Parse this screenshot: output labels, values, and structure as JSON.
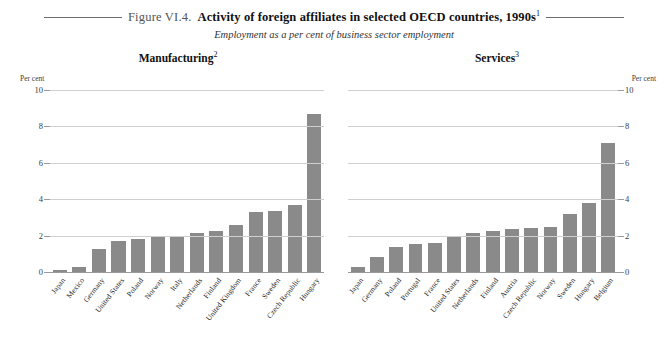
{
  "figure": {
    "label": "Figure VI.4.",
    "title": "Activity of foreign affiliates in selected OECD countries, 1990s",
    "title_footnote": "1",
    "subtitle": "Employment as a per cent of business sector employment"
  },
  "axis": {
    "unit_caption": "Per cent",
    "ticks": [
      "10",
      "8",
      "6",
      "4",
      "2",
      "0"
    ]
  },
  "chart_data": [
    {
      "type": "bar",
      "title": "Manufacturing",
      "title_footnote": "2",
      "xlabel": "",
      "ylabel": "Per cent",
      "ylim": [
        0,
        10
      ],
      "yticks": [
        0,
        2,
        4,
        6,
        8,
        10
      ],
      "grid": true,
      "legend": "none",
      "bar_color": "#8a8a8a",
      "categories": [
        "Japan",
        "Mexico",
        "Germany",
        "United States",
        "Poland",
        "Norway",
        "Italy",
        "Netherlands",
        "Finland",
        "United Kingdom",
        "France",
        "Sweden",
        "Czech Republic",
        "Hungary"
      ],
      "values": [
        0.1,
        0.3,
        1.25,
        1.7,
        1.8,
        1.95,
        2.0,
        2.15,
        2.25,
        2.6,
        3.3,
        3.35,
        3.7,
        8.7
      ]
    },
    {
      "type": "bar",
      "title": "Services",
      "title_footnote": "3",
      "xlabel": "",
      "ylabel": "Per cent",
      "ylim": [
        0,
        10
      ],
      "yticks": [
        0,
        2,
        4,
        6,
        8,
        10
      ],
      "grid": true,
      "legend": "none",
      "bar_color": "#8a8a8a",
      "categories": [
        "Japan",
        "Germany",
        "Poland",
        "Portugal",
        "France",
        "United States",
        "Netherlands",
        "Finland",
        "Austria",
        "Czech Republic",
        "Norway",
        "Sweden",
        "Hungary",
        "Belgium"
      ],
      "values": [
        0.3,
        0.8,
        1.4,
        1.55,
        1.6,
        2.0,
        2.15,
        2.25,
        2.35,
        2.4,
        2.45,
        3.2,
        3.8,
        7.1
      ]
    }
  ]
}
